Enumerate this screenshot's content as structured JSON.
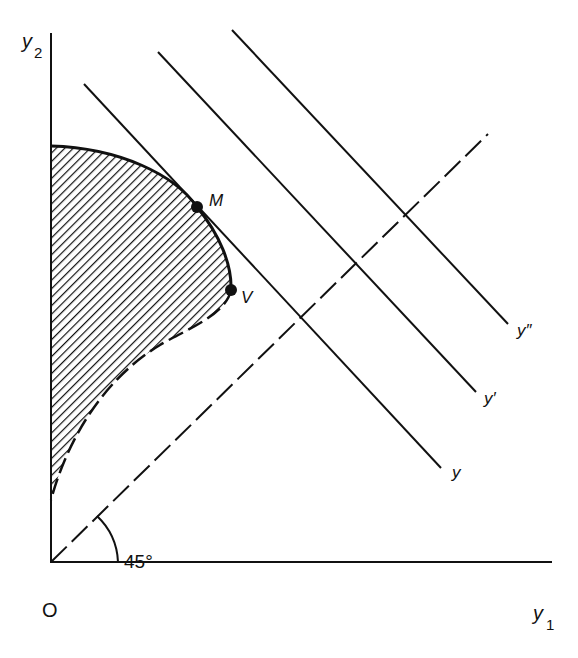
{
  "diagram": {
    "axes": {
      "x_label": "y",
      "x_subscript": "1",
      "y_label": "y",
      "y_subscript": "2",
      "origin_label": "O"
    },
    "angle_label": "45°",
    "points": [
      {
        "name": "M",
        "label": "M"
      },
      {
        "name": "V",
        "label": "V"
      }
    ],
    "iso_lines": [
      {
        "label": "y"
      },
      {
        "label": "y′"
      },
      {
        "label": "y″"
      }
    ],
    "colors": {
      "ink": "#111111",
      "background": "#ffffff"
    }
  }
}
